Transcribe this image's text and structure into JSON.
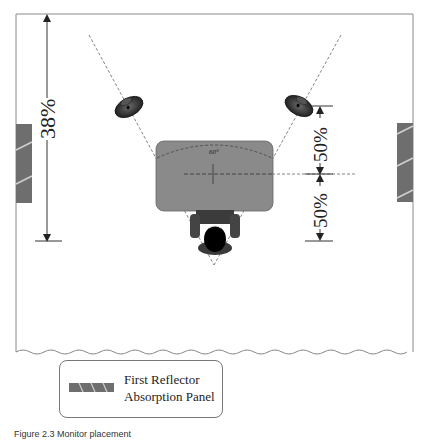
{
  "diagram": {
    "type": "studio-monitor-placement-floorplan",
    "dimensions": {
      "left_distance_label": "38%",
      "right_upper_label": "50%",
      "right_lower_label": "50%"
    },
    "desk": {
      "angle_label": "60°"
    },
    "elements": {
      "left_speaker": "studio monitor (left)",
      "right_speaker": "studio monitor (right)",
      "desk": "mixing desk",
      "listener": "listener in chair",
      "left_panel": "first reflection absorption panel (left wall)",
      "right_panel": "first reflection absorption panel (right wall)"
    },
    "colors": {
      "desk_fill": "#8a8a8a",
      "panel_fill": "#6e6e6e",
      "panel_stripe": "#cfcfcf",
      "line": "#444444",
      "dashed": "#666666",
      "room_border": "#888888"
    }
  },
  "legend": {
    "line1": "First Reflector",
    "line2": "Absorption Panel"
  },
  "caption": {
    "text": "Figure 2.3  Monitor placement"
  }
}
